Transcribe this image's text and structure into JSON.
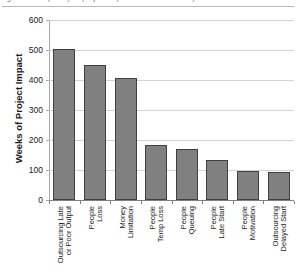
{
  "figure": {
    "caption_remnant": "Figure 3. Frequency of project impact causes ranked by weeks of schedule",
    "ylabel": "Weeks of Project Impact"
  },
  "chart_data": {
    "type": "bar",
    "title": "",
    "xlabel": "",
    "ylabel": "Weeks of Project Impact",
    "ylim": [
      0,
      600
    ],
    "yticks": [
      0,
      100,
      200,
      300,
      400,
      500,
      600
    ],
    "grid": true,
    "legend": "none",
    "bar_color": "#808080",
    "bar_edge_color": "#404040",
    "grid_color": "#d4d4d4",
    "categories": [
      "Outsourcing Late or Poor Output",
      "People Loss",
      "Money Limitation",
      "People Temp Loss",
      "People Queuing",
      "People Late Start",
      "People Motivation",
      "Outsourcing Delayed Start"
    ],
    "category_lines": [
      [
        "Outsourcing Late",
        "or Poor Output"
      ],
      [
        "People",
        "Loss"
      ],
      [
        "Money",
        "Limitation"
      ],
      [
        "People",
        "Temp Loss"
      ],
      [
        "People",
        "Queuing"
      ],
      [
        "People",
        "Late Start"
      ],
      [
        "People",
        "Motivation"
      ],
      [
        "Outsourcing",
        "Delayed Start"
      ]
    ],
    "values": [
      505,
      450,
      408,
      185,
      170,
      133,
      97,
      95
    ]
  }
}
